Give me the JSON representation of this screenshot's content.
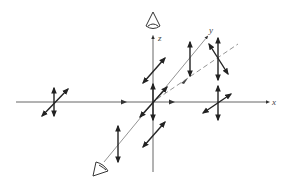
{
  "diagram": {
    "axes": {
      "x_label": "x",
      "y_label": "y",
      "z_label": "z"
    },
    "observers": [
      {
        "name": "eye-top",
        "position": "along +z axis"
      },
      {
        "name": "eye-front",
        "position": "along -y axis"
      }
    ],
    "polarization_markers": [
      {
        "name": "incident-left",
        "type": "double (vertical + diagonal)"
      },
      {
        "name": "origin",
        "type": "double (vertical + diagonal)"
      },
      {
        "name": "right-on-x",
        "type": "double (vertical + diagonal)"
      },
      {
        "name": "upper-on-z",
        "type": "diagonal only"
      },
      {
        "name": "lower-on-z",
        "type": "diagonal only"
      },
      {
        "name": "along-y-upper",
        "type": "vertical only"
      },
      {
        "name": "along-y-lower",
        "type": "vertical only"
      },
      {
        "name": "upper-right-dashed",
        "type": "vertical + crossed diagonal"
      }
    ],
    "colors": {
      "line": "#222222",
      "axis": "#555555",
      "background": "#ffffff"
    }
  }
}
